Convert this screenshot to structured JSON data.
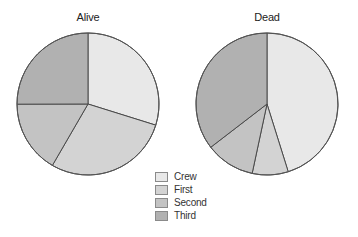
{
  "chart_data": [
    {
      "type": "pie",
      "title": "Alive",
      "categories": [
        "Crew",
        "First",
        "Second",
        "Third"
      ],
      "values": [
        212,
        203,
        118,
        178
      ],
      "percent": [
        29.8,
        28.6,
        16.6,
        25.0
      ],
      "center": [
        88,
        104
      ],
      "radius": 71
    },
    {
      "type": "pie",
      "title": "Dead",
      "categories": [
        "Crew",
        "First",
        "Second",
        "Third"
      ],
      "values": [
        673,
        122,
        167,
        528
      ],
      "percent": [
        45.2,
        8.2,
        11.2,
        35.4
      ],
      "center": [
        267,
        104
      ],
      "radius": 71
    }
  ],
  "legend": {
    "position": "bottom-center",
    "items": [
      {
        "label": "Crew",
        "color": "#e8e8e8"
      },
      {
        "label": "First",
        "color": "#d3d3d3"
      },
      {
        "label": "Second",
        "color": "#c3c3c3"
      },
      {
        "label": "Third",
        "color": "#b1b1b1"
      }
    ]
  },
  "titles": {
    "alive": "Alive",
    "dead": "Dead"
  }
}
